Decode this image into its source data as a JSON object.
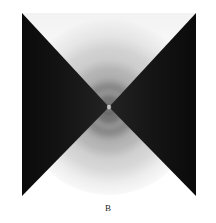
{
  "figure": {
    "caption": "B",
    "alt_description": "Grayscale conoscopic interference pattern: dark bowtie (hourglass) isogyre crossing a circular radial gradient field",
    "plate": {
      "x": 22,
      "y": 13,
      "width": 174,
      "height": 183,
      "center_x": 87,
      "center_y": 94
    },
    "colors": {
      "background": "#ffffff",
      "isogyre_dark": "#111111",
      "isogyre_dark_edge": "#1f1f1f",
      "field_bright": "#f2f2f2",
      "field_mid": "#bdbdbd",
      "field_core": "#6f6f6f",
      "caption_text": "#1d1d1d"
    },
    "pattern": {
      "type": "conoscopic-interference",
      "isogyre_shape": "bowtie",
      "isogyre_orientation": "horizontal-apex-at-center",
      "ring_count": 6,
      "disc_radius": 84
    },
    "rings": [
      {
        "stop": 0,
        "gray": "#7d7d7d"
      },
      {
        "stop": 0.06,
        "gray": "#6e6e6e"
      },
      {
        "stop": 0.14,
        "gray": "#8a8a8a"
      },
      {
        "stop": 0.22,
        "gray": "#a5a5a5"
      },
      {
        "stop": 0.3,
        "gray": "#9a9a9a"
      },
      {
        "stop": 0.4,
        "gray": "#b4b4b4"
      },
      {
        "stop": 0.5,
        "gray": "#c9c9c9"
      },
      {
        "stop": 0.6,
        "gray": "#d5d5d5"
      },
      {
        "stop": 0.7,
        "gray": "#e2e2e2"
      },
      {
        "stop": 0.8,
        "gray": "#ededed"
      },
      {
        "stop": 0.9,
        "gray": "#f4f4f4"
      },
      {
        "stop": 1.0,
        "gray": "#ffffff"
      }
    ]
  }
}
